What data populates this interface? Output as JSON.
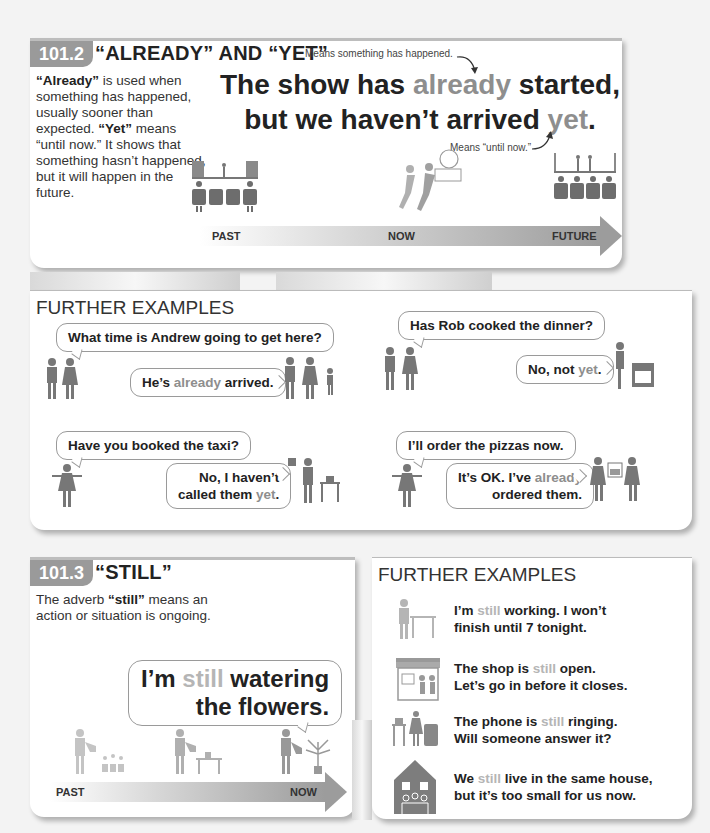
{
  "section_1012": {
    "number": "101.2",
    "title": "“ALREADY” AND “YET”",
    "intro": {
      "already_word": "“Already”",
      "already_text": " is used when something has happened, usually sooner than expected. ",
      "yet_word": "“Yet”",
      "yet_text": " means “until now.” It shows that something hasn’t happened, but it will happen in the future."
    },
    "note_top": "Means something has happened.",
    "note_bottom": "Means “until now.”",
    "sentence": {
      "part1": "The show has ",
      "already": "already",
      "part2": " started,",
      "part3": "but we haven’t arrived ",
      "yet": "yet",
      "part4": "."
    },
    "timeline": {
      "labels": [
        "PAST",
        "NOW",
        "FUTURE"
      ]
    }
  },
  "further_examples_1": {
    "title": "FURTHER EXAMPLES",
    "dialogs": [
      {
        "question": "What time is Andrew going to get here?",
        "answer_a": "He’s ",
        "answer_hl": "already",
        "answer_b": " arrived.",
        "answer_c": ""
      },
      {
        "question": "Has Rob cooked the dinner?",
        "answer_a": "No, not ",
        "answer_hl": "yet",
        "answer_b": ".",
        "answer_c": ""
      },
      {
        "question": "Have you booked the taxi?",
        "answer_a": "No, I haven’t",
        "answer_c": "called them ",
        "answer_hl": "yet",
        "answer_b": "."
      },
      {
        "question": "I’ll order the pizzas now.",
        "answer_a": "It’s OK. I’ve ",
        "answer_hl": "already",
        "answer_c": "ordered them.",
        "answer_b": ""
      }
    ]
  },
  "section_1013": {
    "number": "101.3",
    "title": "“STILL”",
    "intro_a": "The adverb ",
    "intro_word": "“still”",
    "intro_b": " means an action or situation is ongoing.",
    "bubble": {
      "a": "I’m ",
      "hl": "still",
      "b": " watering",
      "c": "the flowers."
    },
    "timeline": {
      "labels": [
        "PAST",
        "NOW"
      ]
    }
  },
  "further_examples_2": {
    "title": "FURTHER EXAMPLES",
    "items": [
      {
        "icon": "person-working-icon",
        "a": "I’m ",
        "hl": "still",
        "b": " working. I won’t",
        "c": "finish until 7 tonight."
      },
      {
        "icon": "shop-icon",
        "a": "The shop is ",
        "hl": "still",
        "b": " open.",
        "c": "Let’s go in before it closes."
      },
      {
        "icon": "ringing-phone-icon",
        "a": "The phone is ",
        "hl": "still",
        "b": " ringing.",
        "c": "Will someone answer it?"
      },
      {
        "icon": "house-family-icon",
        "a": "We ",
        "hl": "still",
        "b": " live in the same house,",
        "c": "but it’s too small for us now."
      }
    ]
  },
  "colors": {
    "badge": "#9a9a9a",
    "highlight": "#8e8e8e",
    "highlight_light": "#b5b5b5",
    "figure": "#7d7d7d"
  }
}
